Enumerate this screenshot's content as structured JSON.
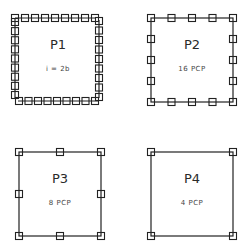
{
  "panels": [
    {
      "id": "P1",
      "title": "P1",
      "subtitle": "i = 2b",
      "control_points_per_side": 9,
      "box": {
        "x": 15,
        "y": 18,
        "w": 84,
        "h": 83
      },
      "offset_style": "staggered"
    },
    {
      "id": "P2",
      "title": "P2",
      "subtitle": "16  PCP",
      "control_points_per_side": 5,
      "box": {
        "x": 151,
        "y": 18,
        "w": 82,
        "h": 84
      }
    },
    {
      "id": "P3",
      "title": "P3",
      "subtitle": "8  PCP",
      "control_points_per_side": 3,
      "box": {
        "x": 19,
        "y": 152,
        "w": 82,
        "h": 84
      }
    },
    {
      "id": "P4",
      "title": "P4",
      "subtitle": "4  PCP",
      "control_points_per_side": 2,
      "box": {
        "x": 151,
        "y": 152,
        "w": 82,
        "h": 84
      }
    }
  ],
  "colors": {
    "line": "#222222",
    "background": "#ffffff"
  }
}
